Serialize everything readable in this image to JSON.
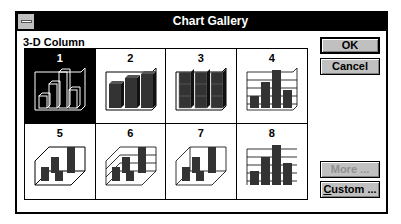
{
  "dialog": {
    "title": "Chart Gallery",
    "group_label": "3-D Column",
    "selected_index": 1
  },
  "gallery": {
    "items": [
      {
        "number": "1",
        "selected": true
      },
      {
        "number": "2",
        "selected": false
      },
      {
        "number": "3",
        "selected": false
      },
      {
        "number": "4",
        "selected": false
      },
      {
        "number": "5",
        "selected": false
      },
      {
        "number": "6",
        "selected": false
      },
      {
        "number": "7",
        "selected": false
      },
      {
        "number": "8",
        "selected": false
      }
    ]
  },
  "buttons": {
    "ok": "OK",
    "cancel": "Cancel",
    "more": "More ...",
    "more_disabled": true,
    "custom_prefix": "C",
    "custom_rest": "ustom ..."
  },
  "colors": {
    "titlebar": "#000000",
    "button_face": "#c0c0c0",
    "bar_fill": "#333333"
  }
}
